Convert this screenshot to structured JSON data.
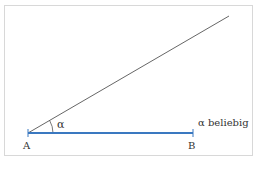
{
  "diagram": {
    "title": "",
    "points": {
      "A": {
        "label": "A",
        "x": 28,
        "y": 133
      },
      "B": {
        "label": "B",
        "x": 193,
        "y": 133
      }
    },
    "ray_end": {
      "x": 229,
      "y": 16
    },
    "angle_label": "α",
    "annotation": "α beliebig",
    "colors": {
      "segment": "#3a78c0",
      "ray": "#555555",
      "frame": "#d8d8d8",
      "text": "#333333"
    }
  }
}
